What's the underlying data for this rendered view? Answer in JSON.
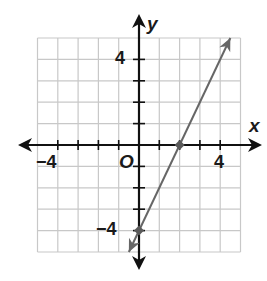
{
  "chart_data": {
    "type": "line",
    "title": "",
    "xlabel": "x",
    "ylabel": "y",
    "origin_label": "O",
    "xlim": [
      -5,
      5
    ],
    "ylim": [
      -5,
      5
    ],
    "grid": true,
    "grid_step": 1,
    "x_tick_labels": [
      {
        "value": -4,
        "label": "−4"
      },
      {
        "value": 4,
        "label": "4"
      }
    ],
    "y_tick_labels": [
      {
        "value": 4,
        "label": "4"
      },
      {
        "value": -4,
        "label": "−4"
      }
    ],
    "series": [
      {
        "name": "line",
        "equation": "y = 2x - 4",
        "slope": 2,
        "intercept": -4,
        "x": [
          -0.5,
          4.5
        ],
        "y": [
          -5,
          5
        ],
        "arrows_both_ends": true,
        "color": "#666666"
      }
    ],
    "points": [
      {
        "x": 2,
        "y": 0,
        "label": ""
      },
      {
        "x": 0,
        "y": -4,
        "label": ""
      }
    ],
    "legend": null
  },
  "colors": {
    "grid": "#c8c8c8",
    "axis": "#111111",
    "line": "#666666",
    "point": "#5a5a5a"
  }
}
